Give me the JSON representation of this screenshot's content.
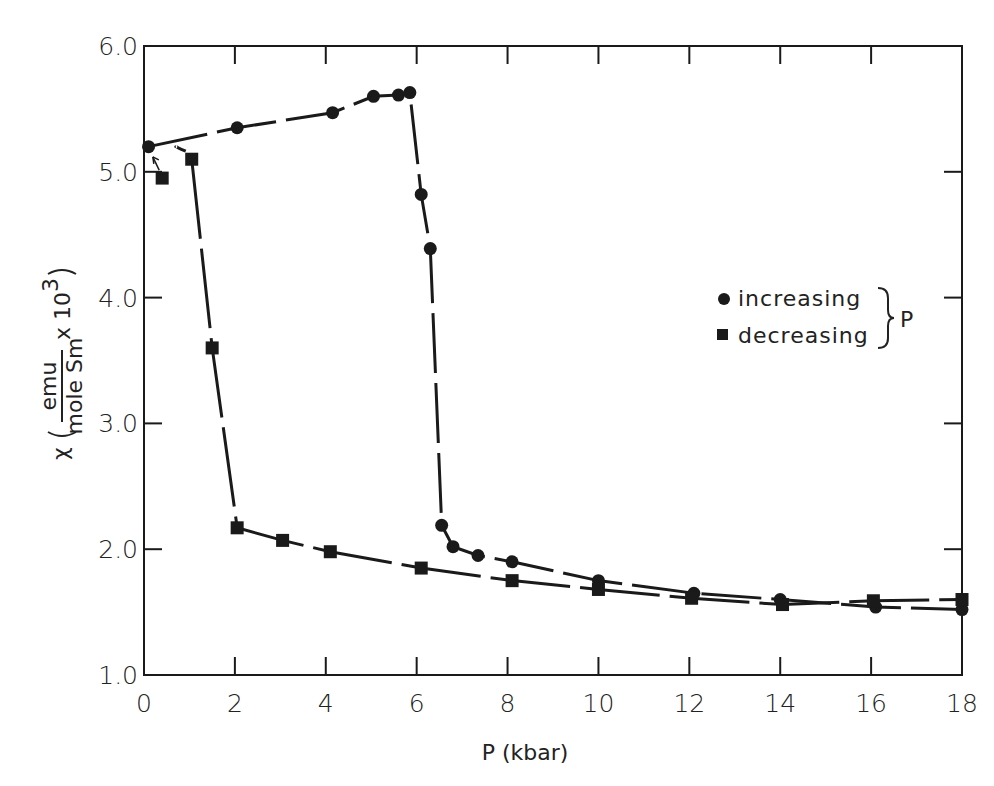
{
  "chart_data": {
    "type": "line",
    "title": "",
    "xlabel": "P (kbar)",
    "ylabel": "χ (emu / mole Sm x 10^3)",
    "ylabel_parts": {
      "symbol": "χ",
      "numerator": "emu",
      "denominator": "mole Sm",
      "multiplier": "x 10",
      "exponent": "3"
    },
    "xlim": [
      0,
      18
    ],
    "ylim": [
      1.0,
      6.0
    ],
    "x_ticks": [
      0,
      2,
      4,
      6,
      8,
      10,
      12,
      14,
      16,
      18
    ],
    "x_tick_labels": [
      "0",
      "2",
      "4",
      "6",
      "8",
      "10",
      "12",
      "14",
      "16",
      "18"
    ],
    "y_ticks": [
      1.0,
      2.0,
      3.0,
      4.0,
      5.0,
      6.0
    ],
    "y_tick_labels": [
      "1.0",
      "2.0",
      "3.0",
      "4.0",
      "5.0",
      "6.0"
    ],
    "grid": false,
    "legend_position": "right-middle",
    "legend_group_label": "P",
    "series": [
      {
        "name": "increasing",
        "marker": "circle",
        "line": "dashed",
        "points": [
          [
            0.1,
            5.2
          ],
          [
            2.05,
            5.35
          ],
          [
            4.15,
            5.47
          ],
          [
            5.05,
            5.6
          ],
          [
            5.6,
            5.61
          ],
          [
            5.85,
            5.63
          ],
          [
            6.1,
            4.82
          ],
          [
            6.3,
            4.39
          ],
          [
            6.55,
            2.19
          ],
          [
            6.8,
            2.02
          ],
          [
            7.35,
            1.95
          ],
          [
            8.1,
            1.9
          ],
          [
            10.0,
            1.75
          ],
          [
            12.1,
            1.65
          ],
          [
            14.0,
            1.6
          ],
          [
            16.1,
            1.54
          ],
          [
            18.0,
            1.52
          ]
        ]
      },
      {
        "name": "decreasing",
        "marker": "square",
        "line": "solid",
        "points": [
          [
            0.4,
            4.95
          ],
          [
            1.05,
            5.1
          ],
          [
            1.5,
            3.6
          ],
          [
            2.05,
            2.17
          ],
          [
            3.05,
            2.07
          ],
          [
            4.1,
            1.98
          ],
          [
            6.1,
            1.85
          ],
          [
            8.1,
            1.75
          ],
          [
            10.0,
            1.68
          ],
          [
            12.05,
            1.61
          ],
          [
            14.05,
            1.56
          ],
          [
            16.05,
            1.59
          ],
          [
            18.0,
            1.6
          ]
        ]
      }
    ],
    "annotations": [
      {
        "type": "arrow",
        "from": [
          0.4,
          4.95
        ],
        "to": [
          0.15,
          5.15
        ],
        "note": "points from first decreasing point to starting value"
      }
    ]
  },
  "legend": {
    "items": [
      {
        "label": "increasing",
        "marker": "circle"
      },
      {
        "label": "decreasing",
        "marker": "square"
      }
    ],
    "group_label": "P"
  },
  "axes": {
    "x_title": "P (kbar)",
    "y_symbol": "χ",
    "y_numerator": "emu",
    "y_denominator": "mole Sm",
    "y_multiplier": "x 10",
    "y_exponent": "3"
  },
  "colors": {
    "ink": "#1a1a1a",
    "background": "#ffffff"
  }
}
